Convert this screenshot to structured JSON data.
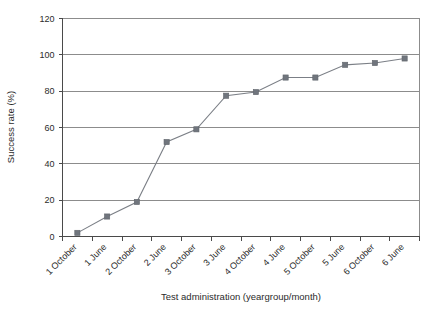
{
  "chart_data": {
    "type": "line",
    "title": "",
    "xlabel": "Test administration (yeargroup/month)",
    "ylabel": "Success rate (%)",
    "categories": [
      "1 October",
      "1 June",
      "2 October",
      "2 June",
      "3 October",
      "3 June",
      "4 October",
      "4 June",
      "5 October",
      "5 June",
      "6 October",
      "6 June"
    ],
    "values": [
      2,
      11,
      19,
      52,
      59,
      77.5,
      79.5,
      87.5,
      87.5,
      94.5,
      95.5,
      98
    ],
    "ylim": [
      0,
      120
    ],
    "yticks": [
      0,
      20,
      40,
      60,
      80,
      100,
      120
    ],
    "ytick_labels": [
      "0",
      "20",
      "40",
      "60",
      "80",
      "100",
      "120"
    ],
    "grid": "horizontal",
    "legend": "none",
    "marker": "square",
    "series_color": "#70757d",
    "line_color": "#7b7f86",
    "grid_color": "#8c8c8c",
    "axis_color": "#4a4a4a",
    "xtick_label_rotation": -45
  }
}
